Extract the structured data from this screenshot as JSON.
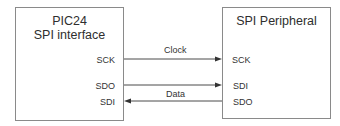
{
  "diagram": {
    "left_block": {
      "title_line1": "PIC24",
      "title_line2": "SPI interface",
      "pins": [
        "SCK",
        "SDO",
        "SDI"
      ]
    },
    "right_block": {
      "title": "SPI Peripheral",
      "pins": [
        "SCK",
        "SDI",
        "SDO"
      ]
    },
    "connections": [
      {
        "from": "PIC24.SCK",
        "to": "SPI Peripheral.SCK",
        "label": "Clock",
        "direction": "right"
      },
      {
        "from": "PIC24.SDO",
        "to": "SPI Peripheral.SDI",
        "label": "",
        "direction": "right"
      },
      {
        "from": "SPI Peripheral.SDO",
        "to": "PIC24.SDI",
        "label": "Data",
        "direction": "left"
      }
    ],
    "colors": {
      "line": "#4a4a4a",
      "border": "#8a8a8a",
      "text": "#2e2e2e"
    }
  }
}
